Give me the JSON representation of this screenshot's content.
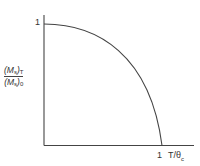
{
  "chart_data": {
    "type": "line",
    "title": "",
    "xlabel": "T/θc",
    "ylabel": "(Ms)T / (Ms)0",
    "ylabel_parts": {
      "numerator_main": "(M",
      "numerator_sub": "s",
      "numerator_close": ")",
      "numerator_subscript": "T",
      "denominator_main": "(M",
      "denominator_sub": "s",
      "denominator_close": ")",
      "denominator_subscript": "0"
    },
    "x_ticks": [
      {
        "value": 1,
        "label": "1"
      }
    ],
    "y_ticks": [
      {
        "value": 1,
        "label": "1"
      }
    ],
    "xlim": [
      0,
      1.25
    ],
    "ylim": [
      0,
      1.15
    ],
    "grid": false,
    "legend": null,
    "series": [
      {
        "name": "Spontaneous magnetization",
        "x": [
          0.0,
          0.1,
          0.2,
          0.3,
          0.4,
          0.5,
          0.6,
          0.7,
          0.8,
          0.9,
          0.95,
          1.0
        ],
        "y": [
          1.0,
          0.995,
          0.98,
          0.955,
          0.92,
          0.87,
          0.8,
          0.71,
          0.59,
          0.42,
          0.3,
          0.0
        ]
      }
    ]
  },
  "labels": {
    "y_tick_1": "1",
    "x_tick_1": "1",
    "x_axis_label": "T/θ",
    "x_axis_label_sub": "c"
  }
}
